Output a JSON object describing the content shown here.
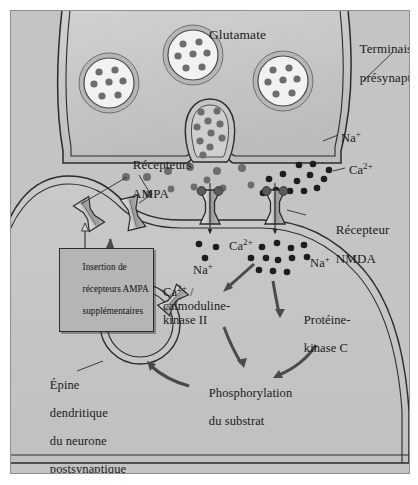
{
  "figure": {
    "type": "biological-schematic",
    "background_color": "#b9b9b9",
    "frame_border_color": "#8e8e8e"
  },
  "colors": {
    "presynaptic_fill": "#c6c6c6",
    "postsynaptic_fill": "#c2c2c2",
    "cleft_fill": "#cfcfcf",
    "vesicle_fill": "#f2f2f2",
    "vesicle_ring": "#b0b0b0",
    "glutamate_dot": "#6d6d6d",
    "calcium_dot": "#1d1d1d",
    "sodium_dot": "#1d1d1d",
    "receptor_body": "#c8c8c8",
    "receptor_shade": "#8a8a8a",
    "receptor_cap": "#5a5a5a",
    "outline": "#2b2b2b",
    "arrow_fill": "#4a4a4a",
    "box_fill": "#b5b5b5",
    "text": "#1a1a1a"
  },
  "labels": {
    "glutamate": "Glutamate",
    "presynaptic_terminal_line1": "Terminaison",
    "presynaptic_terminal_line2": "présynaptique",
    "ampa_receptors_line1": "Récepteurs",
    "ampa_receptors_line2": "AMPA",
    "nmda_receptor_line1": "Récepteur",
    "nmda_receptor_line2": "NMDA",
    "sodium_cleft": "Na",
    "sodium_cleft_charge": "+",
    "calcium_cleft": "Ca",
    "calcium_cleft_charge": "2+",
    "sodium_left_inner": "Na",
    "sodium_left_inner_charge": "+",
    "calcium_inner": "Ca",
    "calcium_inner_charge": "2+",
    "sodium_right_inner": "Na",
    "sodium_right_inner_charge": "+",
    "camk_line1_base": "Ca",
    "camk_line1_charge": "2+",
    "camk_line1_suffix": " /",
    "camk_line2": "calmoduline-",
    "camk_line3": "kinase II",
    "pkc_line1": "Protéine-",
    "pkc_line2": "kinase C",
    "phosphorylation_line1": "Phosphorylation",
    "phosphorylation_line2": "du substrat",
    "spine_line1": "Épine",
    "spine_line2": "dendritique",
    "spine_line3": "du neurone",
    "spine_line4": "postsynaptique",
    "insertion_box_line1": "Insertion de",
    "insertion_box_line2": "récepteurs AMPA",
    "insertion_box_line3": "supplémentaires"
  },
  "vesicles": [
    {
      "name": "vesicle-left",
      "cx": 98,
      "cy": 72,
      "r": 30,
      "dot_count": 7
    },
    {
      "name": "vesicle-top",
      "cx": 182,
      "cy": 44,
      "r": 30,
      "dot_count": 7
    },
    {
      "name": "vesicle-right",
      "cx": 272,
      "cy": 70,
      "r": 30,
      "dot_count": 7
    },
    {
      "name": "vesicle-fusing",
      "cx": 199,
      "cy": 113,
      "r": 26,
      "dot_count": 10
    }
  ],
  "receptors": [
    {
      "name": "ampa-receptor-far-left",
      "x": 78,
      "y": 203,
      "type": "AMPA"
    },
    {
      "name": "ampa-receptor-left",
      "x": 122,
      "y": 202,
      "type": "AMPA"
    },
    {
      "name": "nmda-receptor-left",
      "x": 199,
      "y": 196,
      "type": "NMDA"
    },
    {
      "name": "nmda-receptor-right",
      "x": 264,
      "y": 196,
      "type": "NMDA"
    },
    {
      "name": "ampa-receptor-vesicle-left",
      "x": 97,
      "y": 290,
      "type": "AMPA"
    },
    {
      "name": "ampa-receptor-vesicle-right",
      "x": 161,
      "y": 290,
      "type": "AMPA"
    }
  ],
  "ions": {
    "glutamate_cleft": [
      [
        157,
        144
      ],
      [
        179,
        138
      ],
      [
        201,
        146
      ],
      [
        211,
        127
      ],
      [
        224,
        142
      ],
      [
        248,
        140
      ],
      [
        142,
        158
      ],
      [
        168,
        160
      ],
      [
        193,
        161
      ],
      [
        176,
        175
      ],
      [
        150,
        178
      ],
      [
        232,
        159
      ]
    ],
    "calcium_cleft": [
      [
        262,
        152
      ],
      [
        276,
        146
      ],
      [
        289,
        153
      ],
      [
        300,
        147
      ],
      [
        268,
        163
      ],
      [
        281,
        163
      ],
      [
        295,
        163
      ],
      [
        307,
        160
      ],
      [
        255,
        167
      ],
      [
        318,
        152
      ],
      [
        290,
        137
      ],
      [
        305,
        137
      ]
    ],
    "sodium_below_left": [
      [
        177,
        229
      ],
      [
        193,
        232
      ],
      [
        183,
        243
      ]
    ],
    "inner_ions": [
      [
        251,
        232
      ],
      [
        265,
        228
      ],
      [
        279,
        233
      ],
      [
        291,
        230
      ],
      [
        243,
        243
      ],
      [
        257,
        243
      ],
      [
        268,
        245
      ],
      [
        282,
        243
      ],
      [
        296,
        241
      ],
      [
        263,
        255
      ],
      [
        277,
        256
      ],
      [
        250,
        256
      ]
    ]
  },
  "arrows": [
    {
      "name": "arrow-camk",
      "from": "ion-cloud",
      "to": "camk-label"
    },
    {
      "name": "arrow-pkc",
      "from": "ion-cloud",
      "to": "pkc-label"
    },
    {
      "name": "arrow-camk-to-phospho",
      "from": "camk-label",
      "to": "phosphorylation-label"
    },
    {
      "name": "arrow-pkc-to-phospho",
      "from": "pkc-label",
      "to": "phosphorylation-label"
    },
    {
      "name": "arrow-phospho-to-vesicle",
      "from": "phosphorylation-label",
      "to": "ampa-vesicle"
    },
    {
      "name": "arrow-vesicle-to-membrane",
      "from": "ampa-vesicle",
      "to": "postsynaptic-membrane"
    }
  ]
}
